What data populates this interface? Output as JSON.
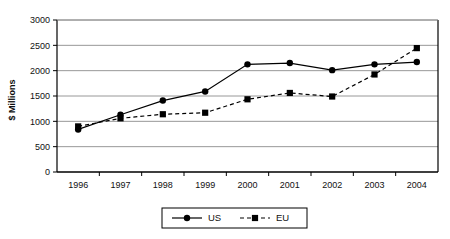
{
  "chart_data": {
    "type": "line",
    "title": "",
    "subtitle": "",
    "xlabel": "",
    "ylabel": "$ Millions",
    "categories": [
      "1996",
      "1997",
      "1998",
      "1999",
      "2000",
      "2001",
      "2002",
      "2003",
      "2004"
    ],
    "series": [
      {
        "name": "US",
        "marker": "circle",
        "line_style": "solid",
        "color": "#000000",
        "values": [
          840,
          1130,
          1410,
          1590,
          2125,
          2150,
          2010,
          2125,
          2170
        ]
      },
      {
        "name": "EU",
        "marker": "square",
        "line_style": "dashed",
        "color": "#000000",
        "values": [
          900,
          1060,
          1140,
          1170,
          1435,
          1560,
          1490,
          1925,
          2445
        ]
      }
    ],
    "ylim": [
      0,
      3000
    ],
    "yticks": [
      0,
      500,
      1000,
      1500,
      2000,
      2500,
      3000
    ],
    "ytick_labels": [
      "0",
      "500",
      "1000",
      "1500",
      "2000",
      "2500",
      "3000"
    ],
    "grid": true,
    "grid_axis": "y",
    "legend_position": "bottom",
    "legend_entries": [
      "US",
      "EU"
    ],
    "plot_bgcolor": "#ffffff",
    "axis_color": "#000000",
    "grid_color": "#8c8c8c"
  }
}
